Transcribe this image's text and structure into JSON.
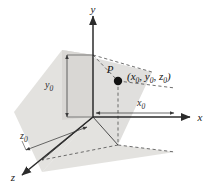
{
  "figure": {
    "background_color": "#ffffff"
  },
  "axes": [
    {
      "name": "y-axis",
      "label": "y",
      "direction": "up",
      "label_x": 93,
      "label_y": 13
    },
    {
      "name": "x-axis",
      "label": "x",
      "direction": "right",
      "label_x": 200,
      "label_y": 117
    },
    {
      "name": "z-axis",
      "label": "z",
      "direction": "down-left",
      "label_x": 13,
      "label_y": 180
    }
  ],
  "point": {
    "name": "P",
    "label": "P",
    "coordinates_text": "(x₀, y₀, z₀)",
    "coord_x_label": "x",
    "coord_x_sub": "0",
    "coord_y_label": "y",
    "coord_y_sub": "0",
    "coord_z_label": "z",
    "coord_z_sub": "0",
    "marker_cx": 118,
    "marker_cy": 81,
    "marker_r": 4.2,
    "label_x": 113,
    "label_y": 73,
    "coords_x": 128,
    "coords_y": 79
  },
  "measurements": [
    {
      "name": "x-offset",
      "label": "x",
      "sub": "0",
      "label_x": 140,
      "label_y": 105
    },
    {
      "name": "y-offset",
      "label": "y",
      "sub": "0",
      "label_x": 48,
      "label_y": 87
    },
    {
      "name": "z-offset",
      "label": "z",
      "sub": "0",
      "label_x": 22,
      "label_y": 137
    }
  ],
  "colors": {
    "line": "#2b2b2b",
    "dashed": "#4a4a4a",
    "shadow_light": "#e3e2e0",
    "shadow_mid": "#d6d5d2",
    "shadow_dark": "#cbcac6",
    "point_fill": "#121212",
    "text": "#111111"
  },
  "geometry": {
    "origin_x": 93,
    "origin_y": 117,
    "base_corner_x": 118,
    "base_corner_y": 145,
    "top_corner_x": 93,
    "top_corner_y": 55
  }
}
